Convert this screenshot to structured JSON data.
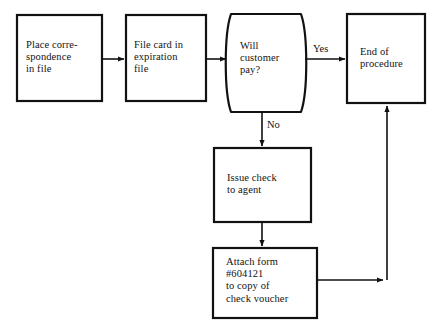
{
  "diagram": {
    "background_color": "#ffffff",
    "stroke_color": "#111111",
    "text_color": "#121212",
    "nodes": [
      {
        "id": "place-correspondence",
        "shape": "process",
        "text": "Place corre-\nspondence\nin file",
        "x": 17,
        "y": 15,
        "w": 85,
        "h": 86
      },
      {
        "id": "file-card",
        "shape": "process",
        "text": "File card in\nexpiration\nfile",
        "x": 126,
        "y": 15,
        "w": 80,
        "h": 86
      },
      {
        "id": "will-customer-pay",
        "shape": "decision-barrel",
        "text": "Will\ncustomer\npay?",
        "x": 221,
        "y": 14,
        "w": 90,
        "h": 98
      },
      {
        "id": "end-of-procedure",
        "shape": "process",
        "text": "End of\nprocedure",
        "x": 347,
        "y": 14,
        "w": 78,
        "h": 89
      },
      {
        "id": "issue-check",
        "shape": "process",
        "text": "Issue check\nto agent",
        "x": 214,
        "y": 148,
        "w": 97,
        "h": 74
      },
      {
        "id": "attach-form",
        "shape": "process",
        "text": "Attach form\n#604121\nto copy of\ncheck voucher",
        "x": 213,
        "y": 248,
        "w": 104,
        "h": 70
      }
    ],
    "edges": [
      {
        "id": "e1",
        "from": "place-correspondence",
        "to": "file-card",
        "label": ""
      },
      {
        "id": "e2",
        "from": "file-card",
        "to": "will-customer-pay",
        "label": ""
      },
      {
        "id": "e3",
        "from": "will-customer-pay",
        "to": "end-of-procedure",
        "label": "Yes"
      },
      {
        "id": "e4",
        "from": "will-customer-pay",
        "to": "issue-check",
        "label": "No"
      },
      {
        "id": "e5",
        "from": "issue-check",
        "to": "attach-form",
        "label": ""
      },
      {
        "id": "e6",
        "from": "attach-form",
        "to": "end-of-procedure",
        "label": ""
      }
    ],
    "edge_labels": {
      "yes": "Yes",
      "no": "No"
    }
  }
}
